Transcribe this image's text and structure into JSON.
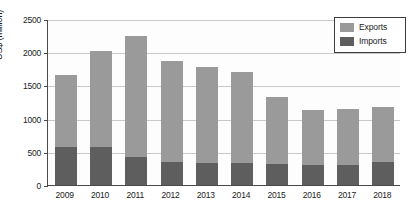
{
  "chart_data": {
    "type": "bar",
    "subtype": "stacked-vertical",
    "title": "",
    "xlabel": "",
    "ylabel": "US$ (million)",
    "categories": [
      "2009",
      "2010",
      "2011",
      "2012",
      "2013",
      "2014",
      "2015",
      "2016",
      "2017",
      "2018"
    ],
    "series": [
      {
        "name": "Imports",
        "color": "#5e5e5e",
        "values": [
          580,
          575,
          425,
          345,
          330,
          335,
          310,
          300,
          300,
          340
        ]
      },
      {
        "name": "Exports",
        "color": "#9a9a9a",
        "values": [
          1070,
          1445,
          1815,
          1525,
          1450,
          1365,
          1010,
          830,
          850,
          840
        ]
      }
    ],
    "totals": [
      1650,
      2020,
      2240,
      1870,
      1780,
      1700,
      1320,
      1130,
      1150,
      1180
    ],
    "ylim": [
      0,
      2500
    ],
    "yticks": [
      0,
      500,
      1000,
      1500,
      2000,
      2500
    ],
    "ytick_labels": [
      "0",
      "500",
      "1000",
      "1500",
      "2000",
      "2500"
    ],
    "grid": "horizontal",
    "legend_position": "top-right",
    "legend_entries": [
      "Exports",
      "Imports"
    ]
  },
  "legend": {
    "exports_label": "Exports",
    "imports_label": "Imports"
  },
  "axes": {
    "y_title": "US$ (million)"
  }
}
